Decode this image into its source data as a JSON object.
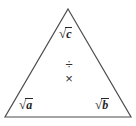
{
  "figure": {
    "type": "triangle-formula-diagram",
    "background_color": "#ffffff",
    "outline_color": "#4d4d4d",
    "text_color": "#262626",
    "apex": {
      "name": "sqrt-c",
      "radical_symbol": "√",
      "radicand": "c",
      "full_text": "√c"
    },
    "bottom_left": {
      "name": "sqrt-a",
      "radical_symbol": "√",
      "radicand": "a",
      "full_text": "√a"
    },
    "bottom_right": {
      "name": "sqrt-b",
      "radical_symbol": "√",
      "radicand": "b",
      "full_text": "√b"
    },
    "operators": {
      "divide": "÷",
      "multiply": "×"
    }
  }
}
